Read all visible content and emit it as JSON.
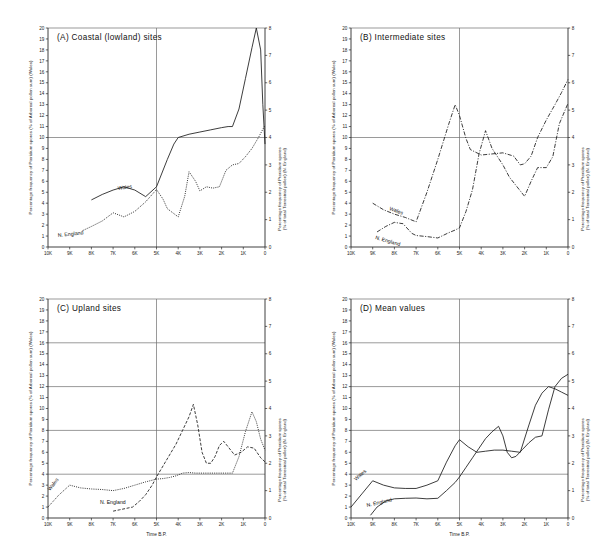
{
  "figure": {
    "xlabel": "Time B.P.",
    "ylabel_left": "Percentage frequency of Pteridium spores (% of Arboreal pollen sum) (Wales)",
    "ylabel_right": "Percentage frequency of Pteridium spores (% of total Terrestrial pollen) (N. England)",
    "xticklabels": [
      "10K",
      "9K",
      "8K",
      "7K",
      "6K",
      "5K",
      "4K",
      "3K",
      "2K",
      "1K",
      "0"
    ],
    "series_label_wales": "Wales",
    "series_label_nengland": "N. England"
  },
  "chart_data": [
    {
      "type": "line",
      "panel": "A",
      "title": "(A)  Coastal  (lowland)  sites",
      "xlabel": "Time B.P.",
      "ylabel": "Percentage frequency of Pteridium spores (% of Arboreal pollen sum) (Wales)",
      "ylabel_right": "Percentage frequency of Pteridium spores (% of total Terrestrial pollen) (N. England)",
      "xlim": [
        10000,
        0
      ],
      "ylim_left": [
        0,
        20
      ],
      "ylim_right": [
        0,
        8
      ],
      "yticks_left": [
        0,
        1,
        2,
        3,
        4,
        5,
        6,
        7,
        8,
        9,
        10,
        11,
        12,
        13,
        14,
        15,
        16,
        17,
        18,
        19,
        20
      ],
      "yticks_right": [
        0,
        1,
        2,
        3,
        4,
        5,
        6,
        7,
        8
      ],
      "xticks": [
        10000,
        9000,
        8000,
        7000,
        6000,
        5000,
        4000,
        3000,
        2000,
        1000,
        0
      ],
      "grid": true,
      "gridlines_y_left": [
        10,
        20
      ],
      "gridline_x": 5000,
      "series": [
        {
          "name": "Wales",
          "style": "solid",
          "axis": "left",
          "x": [
            8000,
            7500,
            7000,
            6500,
            6000,
            5500,
            5000,
            4500,
            4200,
            4000,
            3500,
            3000,
            2500,
            2000,
            1700,
            1500,
            1200,
            900,
            600,
            400,
            200,
            100,
            0
          ],
          "y": [
            4.3,
            4.8,
            5.2,
            5.5,
            5.2,
            4.6,
            5.5,
            8.0,
            9.4,
            10.0,
            10.3,
            10.5,
            10.7,
            10.9,
            11.0,
            11.0,
            12.6,
            15.4,
            18.2,
            20.0,
            18.0,
            13.0,
            9.4
          ]
        },
        {
          "name": "N. England",
          "style": "dotted",
          "axis": "right",
          "x": [
            8400,
            8000,
            7500,
            7000,
            6500,
            6000,
            5500,
            5000,
            4700,
            4500,
            4000,
            3700,
            3500,
            3200,
            3000,
            2700,
            2400,
            2100,
            1800,
            1500,
            1200,
            900,
            600,
            300,
            0
          ],
          "y": [
            0.6,
            0.75,
            0.95,
            1.25,
            1.1,
            1.3,
            1.65,
            2.1,
            1.75,
            1.4,
            1.1,
            1.85,
            2.75,
            2.4,
            2.05,
            2.2,
            2.15,
            2.2,
            2.8,
            3.0,
            3.05,
            3.3,
            3.6,
            4.0,
            4.45
          ]
        }
      ]
    },
    {
      "type": "line",
      "panel": "B",
      "title": "(B)  Intermediate  sites",
      "xlabel": "Time B.P.",
      "ylabel": "Percentage frequency of Pteridium spores (% of Arboreal pollen sum) (Wales)",
      "ylabel_right": "Percentage frequency of Pteridium spores (% of total Terrestrial pollen) (N. England)",
      "xlim": [
        10000,
        0
      ],
      "ylim_left": [
        0,
        20
      ],
      "ylim_right": [
        0,
        8
      ],
      "yticks_left": [
        0,
        1,
        2,
        3,
        4,
        5,
        6,
        7,
        8,
        9,
        10,
        11,
        12,
        13,
        14,
        15,
        16,
        17,
        18,
        19,
        20
      ],
      "yticks_right": [
        0,
        1,
        2,
        3,
        4,
        5,
        6,
        7,
        8
      ],
      "xticks": [
        10000,
        9000,
        8000,
        7000,
        6000,
        5000,
        4000,
        3000,
        2000,
        1000,
        0
      ],
      "grid": true,
      "gridlines_y_left": [
        10,
        20
      ],
      "gridline_x": 5000,
      "series": [
        {
          "name": "Wales",
          "style": "dashdot",
          "axis": "left",
          "x": [
            9000,
            8500,
            8000,
            7500,
            7000,
            6500,
            6000,
            5500,
            5200,
            5000,
            4700,
            4500,
            4000,
            3500,
            3000,
            2500,
            2200,
            2000,
            1700,
            1400,
            1000,
            600,
            300,
            0
          ],
          "y": [
            4.0,
            3.4,
            3.0,
            2.7,
            2.3,
            5.0,
            8.0,
            11.2,
            13.0,
            12.0,
            9.9,
            8.9,
            8.4,
            8.5,
            8.6,
            8.3,
            7.5,
            7.6,
            8.3,
            10.0,
            11.6,
            13.0,
            14.1,
            15.3
          ]
        },
        {
          "name": "N. England",
          "style": "dashdot",
          "axis": "right",
          "x": [
            8800,
            8400,
            8000,
            7600,
            7200,
            7000,
            6500,
            6000,
            5500,
            5200,
            5000,
            4700,
            4400,
            4100,
            3800,
            3500,
            3000,
            2700,
            2400,
            2000,
            1700,
            1400,
            1000,
            700,
            400,
            0
          ],
          "y": [
            0.55,
            0.75,
            0.9,
            0.85,
            0.5,
            0.42,
            0.38,
            0.33,
            0.52,
            0.62,
            0.7,
            1.3,
            2.1,
            3.4,
            4.25,
            3.6,
            3.0,
            2.55,
            2.25,
            1.85,
            2.4,
            2.9,
            2.9,
            3.3,
            4.5,
            5.25
          ]
        }
      ]
    },
    {
      "type": "line",
      "panel": "C",
      "title": "(C)  Upland  sites",
      "xlabel": "Time B.P.",
      "ylabel": "Percentage frequency of Pteridium spores (% of Arboreal pollen sum) (Wales)",
      "ylabel_right": "Percentage frequency of Pteridium spores (% of total Terrestrial pollen) (N. England)",
      "xlim": [
        10000,
        0
      ],
      "ylim_left": [
        0,
        20
      ],
      "ylim_right": [
        0,
        8
      ],
      "yticks_left": [
        0,
        1,
        2,
        3,
        4,
        5,
        6,
        7,
        8,
        9,
        10,
        11,
        12,
        13,
        14,
        15,
        16,
        17,
        18,
        19,
        20
      ],
      "yticks_right": [
        0,
        1,
        2,
        3,
        4,
        5,
        6,
        7,
        8
      ],
      "xticks": [
        10000,
        9000,
        8000,
        7000,
        6000,
        5000,
        4000,
        3000,
        2000,
        1000,
        0
      ],
      "grid": true,
      "gridlines_y_left": [
        4,
        8,
        12,
        16,
        20
      ],
      "gridline_x": 5000,
      "series": [
        {
          "name": "Wales",
          "style": "dotted",
          "axis": "left",
          "x": [
            10000,
            9500,
            9000,
            8500,
            8000,
            7500,
            7000,
            6500,
            6000,
            5500,
            5000,
            4700,
            4400,
            4100,
            3800,
            3500,
            3200,
            3000,
            2700,
            2400,
            2100,
            1800,
            1500,
            1200,
            900,
            600,
            400,
            200,
            0
          ],
          "y": [
            1.0,
            2.1,
            3.0,
            2.75,
            2.65,
            2.6,
            2.5,
            2.7,
            3.0,
            3.3,
            3.55,
            3.6,
            3.7,
            3.85,
            4.1,
            4.15,
            4.1,
            4.1,
            4.1,
            4.1,
            4.1,
            4.1,
            4.1,
            5.6,
            7.9,
            9.7,
            8.8,
            7.2,
            6.2
          ]
        },
        {
          "name": "N. England",
          "style": "dashed",
          "axis": "right",
          "x": [
            7000,
            6700,
            6400,
            6100,
            5800,
            5500,
            5200,
            5000,
            4700,
            4400,
            4100,
            3800,
            3500,
            3300,
            3100,
            2900,
            2700,
            2500,
            2300,
            2100,
            1900,
            1700,
            1400,
            1100,
            800,
            500,
            200,
            0
          ],
          "y": [
            0.25,
            0.3,
            0.35,
            0.4,
            0.6,
            0.85,
            1.2,
            1.5,
            1.9,
            2.3,
            2.7,
            3.2,
            3.7,
            4.15,
            3.4,
            2.4,
            2.0,
            2.0,
            2.25,
            2.65,
            2.8,
            2.6,
            2.3,
            2.4,
            2.6,
            2.55,
            2.2,
            2.05
          ]
        }
      ]
    },
    {
      "type": "line",
      "panel": "D",
      "title": "(D)  Mean  values",
      "xlabel": "Time B.P.",
      "ylabel": "Percentage frequency of Pteridium spores (% of Arboreal pollen sum) (Wales)",
      "ylabel_right": "Percentage frequency of Pteridium spores (% of total Terrestrial pollen) (N. England)",
      "xlim": [
        10000,
        0
      ],
      "ylim_left": [
        0,
        20
      ],
      "ylim_right": [
        0,
        8
      ],
      "yticks_left": [
        0,
        1,
        2,
        3,
        4,
        5,
        6,
        7,
        8,
        9,
        10,
        11,
        12,
        13,
        14,
        15,
        16,
        17,
        18,
        19,
        20
      ],
      "yticks_right": [
        0,
        1,
        2,
        3,
        4,
        5,
        6,
        7,
        8
      ],
      "xticks": [
        10000,
        9000,
        8000,
        7000,
        6000,
        5000,
        4000,
        3000,
        2000,
        1000,
        0
      ],
      "grid": true,
      "gridlines_y_left": [
        4,
        8,
        12,
        16,
        20
      ],
      "gridline_x": 5000,
      "series": [
        {
          "name": "Wales",
          "style": "solid",
          "axis": "left",
          "x": [
            10000,
            9500,
            9000,
            8500,
            8000,
            7500,
            7000,
            6500,
            6000,
            5600,
            5200,
            5000,
            4600,
            4200,
            3800,
            3400,
            3000,
            2600,
            2200,
            1800,
            1500,
            1200,
            900,
            600,
            300,
            0
          ],
          "y": [
            1.0,
            2.2,
            3.4,
            3.0,
            2.75,
            2.7,
            2.7,
            3.0,
            3.4,
            5.1,
            6.6,
            7.15,
            6.5,
            6.0,
            6.1,
            6.2,
            6.2,
            6.1,
            6.0,
            8.5,
            10.3,
            11.4,
            12.0,
            11.8,
            11.5,
            11.2
          ]
        },
        {
          "name": "N. England",
          "style": "solid",
          "axis": "right",
          "x": [
            9100,
            8800,
            8400,
            8000,
            7500,
            7000,
            6500,
            6000,
            5600,
            5200,
            5000,
            4700,
            4400,
            4100,
            3800,
            3500,
            3200,
            3000,
            2800,
            2600,
            2400,
            2100,
            1800,
            1500,
            1200,
            900,
            600,
            300,
            0
          ],
          "y": [
            0.1,
            0.4,
            0.62,
            0.7,
            0.72,
            0.73,
            0.7,
            0.72,
            1.0,
            1.3,
            1.5,
            1.85,
            2.2,
            2.55,
            2.9,
            3.15,
            3.35,
            3.0,
            2.4,
            2.2,
            2.25,
            2.5,
            2.75,
            2.95,
            3.0,
            3.95,
            4.8,
            5.1,
            5.25
          ]
        }
      ]
    }
  ]
}
